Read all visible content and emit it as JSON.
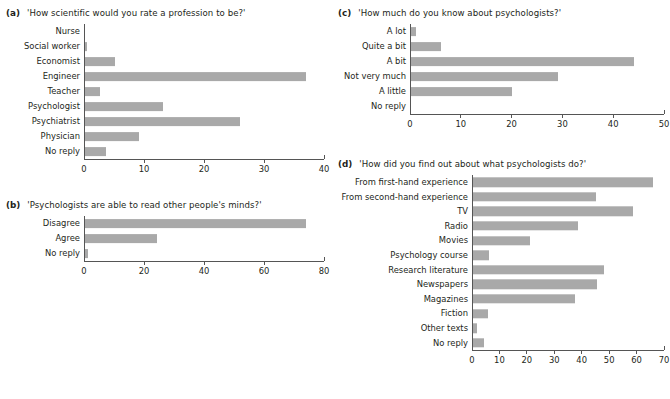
{
  "figure": {
    "background": "#ffffff",
    "bar_color": "#a9a9a9",
    "axis_color": "#555555",
    "text_color": "#231f20"
  },
  "panels": {
    "a": {
      "letter": "(a)",
      "question": "'How scientific would you rate a profession to be?'"
    },
    "b": {
      "letter": "(b)",
      "question": "'Psychologists are able to read other people's minds?'"
    },
    "c": {
      "letter": "(c)",
      "question": "'How much do you know about psychologists?'"
    },
    "d": {
      "letter": "(d)",
      "question": "'How did you find out about what psychologists do?'"
    }
  },
  "chart_data": [
    {
      "panel": "a",
      "type": "bar",
      "orientation": "horizontal",
      "title": "'How scientific would you rate a profession to be?'",
      "xlabel": "",
      "ylabel": "",
      "xlim": [
        0,
        40
      ],
      "xticks": [
        0,
        10,
        20,
        30,
        40
      ],
      "xtick_labels": [
        "0",
        "10",
        "20",
        "30",
        "40"
      ],
      "grid": false,
      "legend": "none",
      "categories": [
        "Nurse",
        "Social worker",
        "Economist",
        "Engineer",
        "Teacher",
        "Psychologist",
        "Psychiatrist",
        "Physician",
        "No reply"
      ],
      "values": [
        0,
        0.3,
        5,
        37,
        2.5,
        13,
        26,
        9,
        3.5
      ]
    },
    {
      "panel": "b",
      "type": "bar",
      "orientation": "horizontal",
      "title": "'Psychologists are able to read other people's minds?'",
      "xlabel": "",
      "ylabel": "",
      "xlim": [
        0,
        80
      ],
      "xticks": [
        0,
        20,
        40,
        60,
        80
      ],
      "xtick_labels": [
        "0",
        "20",
        "40",
        "60",
        "80"
      ],
      "grid": false,
      "legend": "none",
      "categories": [
        "Disagree",
        "Agree",
        "No reply"
      ],
      "values": [
        74,
        24,
        1
      ]
    },
    {
      "panel": "c",
      "type": "bar",
      "orientation": "horizontal",
      "title": "'How much do you know about psychologists?'",
      "xlabel": "",
      "ylabel": "",
      "xlim": [
        0,
        50
      ],
      "xticks": [
        0,
        10,
        20,
        30,
        40,
        50
      ],
      "xtick_labels": [
        "0",
        "10",
        "20",
        "30",
        "40",
        "50"
      ],
      "grid": false,
      "legend": "none",
      "categories": [
        "A lot",
        "Quite a bit",
        "A bit",
        "Not very much",
        "A little",
        "No reply"
      ],
      "values": [
        1,
        6,
        44,
        29,
        20,
        0
      ]
    },
    {
      "panel": "d",
      "type": "bar",
      "orientation": "horizontal",
      "title": "'How did you find out about what psychologists do?'",
      "xlabel": "",
      "ylabel": "",
      "xlim": [
        0,
        70
      ],
      "xticks": [
        0,
        10,
        20,
        30,
        40,
        50,
        60,
        70
      ],
      "xtick_labels": [
        "0",
        "10",
        "20",
        "30",
        "40",
        "50",
        "60",
        "70"
      ],
      "grid": false,
      "legend": "none",
      "categories": [
        "From first-hand experience",
        "From second-hand experience",
        "TV",
        "Radio",
        "Movies",
        "Psychology course",
        "Research literature",
        "Newspapers",
        "Magazines",
        "Fiction",
        "Other texts",
        "No reply"
      ],
      "values": [
        66,
        45,
        58.5,
        38.5,
        21,
        6,
        48,
        45.5,
        37.5,
        5.5,
        1.5,
        4
      ]
    }
  ]
}
